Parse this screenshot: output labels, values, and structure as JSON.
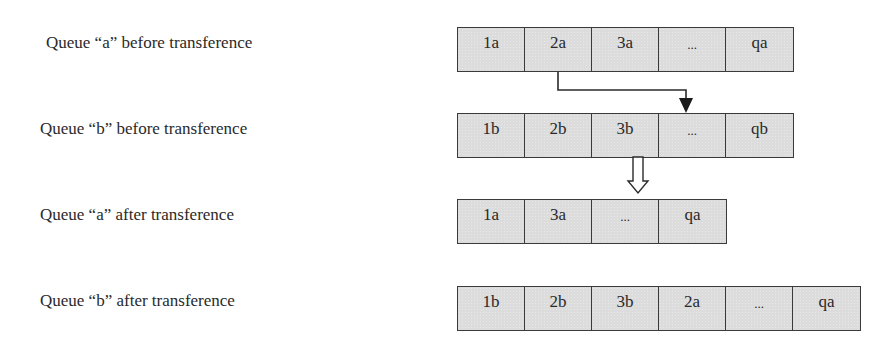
{
  "diagram": {
    "rows": [
      {
        "label": "Queue “a” before transference",
        "cells": [
          "1a",
          "2a",
          "3a",
          "...",
          "qa"
        ]
      },
      {
        "label": "Queue “b” before transference",
        "cells": [
          "1b",
          "2b",
          "3b",
          "...",
          "qb"
        ]
      },
      {
        "label": "Queue “a” after transference",
        "cells": [
          "1a",
          "3a",
          "...",
          "qa"
        ]
      },
      {
        "label": "Queue “b” after transference",
        "cells": [
          "1b",
          "2b",
          "3b",
          "2a",
          "...",
          "qa"
        ]
      }
    ],
    "arrows": [
      {
        "type": "elbow-solid",
        "from": "Queue a cell 2a",
        "to": "Queue b cell ..."
      },
      {
        "type": "hollow-down",
        "meaning": "transference result"
      }
    ],
    "colors": {
      "cell_fill": "#dcdcdc",
      "border": "#3a3a3a",
      "text": "#2a2a2a"
    }
  }
}
